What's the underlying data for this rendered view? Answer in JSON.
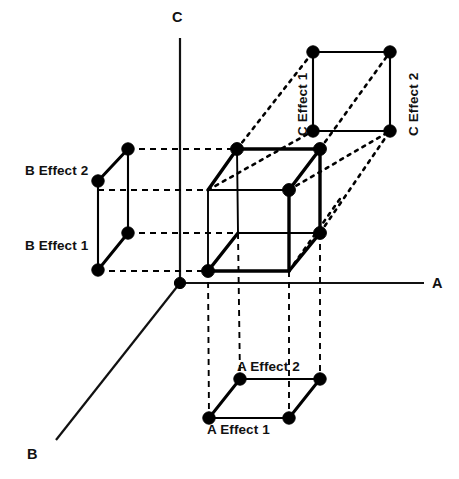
{
  "figure": {
    "type": "diagram",
    "background_color": "#ffffff",
    "ink_color": "#000000"
  },
  "axes": [
    {
      "id": "axis-a",
      "label": "A",
      "direction": "right-horizontal",
      "label_position": {
        "x": 432,
        "y": 276
      },
      "line": {
        "x1": 180,
        "y1": 283,
        "x2": 424,
        "y2": 283
      }
    },
    {
      "id": "axis-b",
      "label": "B",
      "direction": "down-left-diagonal",
      "label_position": {
        "x": 27,
        "y": 447
      },
      "line": {
        "x1": 180,
        "y1": 283,
        "x2": 56,
        "y2": 440
      }
    },
    {
      "id": "axis-c",
      "label": "C",
      "direction": "up-vertical",
      "label_position": {
        "x": 172,
        "y": 16
      },
      "line": {
        "x1": 180,
        "y1": 38,
        "x2": 180,
        "y2": 283
      }
    }
  ],
  "cube": {
    "name": "central-design-cube",
    "vertices": [
      {
        "id": "front-bottom-left",
        "x": 208,
        "y": 271
      },
      {
        "id": "front-bottom-right",
        "x": 289,
        "y": 271
      },
      {
        "id": "front-top-left",
        "x": 208,
        "y": 190
      },
      {
        "id": "front-top-right",
        "x": 289,
        "y": 190
      },
      {
        "id": "back-bottom-left",
        "x": 238,
        "y": 233
      },
      {
        "id": "back-bottom-right",
        "x": 320,
        "y": 233
      },
      {
        "id": "back-top-left",
        "x": 237,
        "y": 149
      },
      {
        "id": "back-top-right",
        "x": 320,
        "y": 149
      }
    ],
    "visible_dot_vertices": [
      "back-top-left",
      "back-top-right",
      "front-top-right",
      "back-bottom-right",
      "front-bottom-left"
    ]
  },
  "projections": {
    "b_projection": {
      "name": "b-effect-projection",
      "position": "left",
      "shape": "parallelogram-pair",
      "labels": [
        {
          "text": "B Effect 2",
          "x": 25,
          "y": 164
        },
        {
          "text": "B Effect 1",
          "x": 25,
          "y": 239
        }
      ],
      "points": [
        {
          "id": "b2-upper-right",
          "x": 128,
          "y": 149
        },
        {
          "id": "b2-lower-left",
          "x": 98,
          "y": 181
        },
        {
          "id": "b1-upper-right",
          "x": 128,
          "y": 233
        },
        {
          "id": "b1-lower-left",
          "x": 98,
          "y": 270
        }
      ]
    },
    "c_projection": {
      "name": "c-effect-projection",
      "position": "top-right",
      "shape": "square",
      "labels": [
        {
          "text": "C Effect 1",
          "x": 296,
          "y": 136,
          "rotation": -90
        },
        {
          "text": "C Effect 2",
          "x": 407,
          "y": 136,
          "rotation": -90
        }
      ],
      "points": [
        {
          "id": "c-top-left",
          "x": 313,
          "y": 52
        },
        {
          "id": "c-top-right",
          "x": 390,
          "y": 52
        },
        {
          "id": "c-bottom-left",
          "x": 313,
          "y": 131
        },
        {
          "id": "c-bottom-right",
          "x": 390,
          "y": 131
        }
      ]
    },
    "a_projection": {
      "name": "a-effect-projection",
      "position": "bottom",
      "shape": "parallelogram",
      "labels": [
        {
          "text": "A Effect 2",
          "x": 237,
          "y": 360
        },
        {
          "text": "A Effect 1",
          "x": 207,
          "y": 423
        }
      ],
      "points": [
        {
          "id": "a-back-left",
          "x": 240,
          "y": 379
        },
        {
          "id": "a-back-right",
          "x": 320,
          "y": 379
        },
        {
          "id": "a-front-left",
          "x": 209,
          "y": 418
        },
        {
          "id": "a-front-right",
          "x": 289,
          "y": 418
        }
      ]
    }
  },
  "legend_text": {
    "a_effect_1": "A Effect 1",
    "a_effect_2": "A Effect 2",
    "b_effect_1": "B Effect 1",
    "b_effect_2": "B Effect 2",
    "c_effect_1": "C Effect 1",
    "c_effect_2": "C Effect 2",
    "axis_a": "A",
    "axis_b": "B",
    "axis_c": "C"
  }
}
